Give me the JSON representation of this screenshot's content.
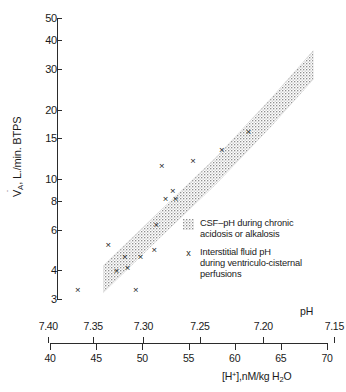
{
  "chart_data": {
    "type": "scatter",
    "title": "",
    "xlabel": "[H⁺], nM/kg H₂O",
    "xlabel_secondary": "pH",
    "ylabel": "V̇A, L./min. BTPS",
    "yscale": "log",
    "ylim": [
      3,
      50
    ],
    "xlim": [
      40,
      70
    ],
    "grid": false,
    "axis_top_label": "pH",
    "axis_bottom_label": "[H+],nM/kg H2O",
    "y_ticks": [
      3,
      4,
      6,
      8,
      10,
      15,
      20,
      30,
      40,
      50
    ],
    "y_tick_labels": [
      "3",
      "4",
      "6",
      "8",
      "10",
      "15",
      "20",
      "30",
      "40",
      "50"
    ],
    "x_ticks_h": [
      40,
      45,
      50,
      55,
      60,
      65,
      70
    ],
    "x_tick_labels_h": [
      "40",
      "45",
      "50",
      "55",
      "60",
      "65",
      "70"
    ],
    "x_ticks_ph": [
      7.4,
      7.35,
      7.3,
      7.25,
      7.2,
      7.15
    ],
    "x_tick_labels_ph": [
      "7.40",
      "7.35",
      "7.30",
      "7.25",
      "7.20",
      "7.15"
    ],
    "series": [
      {
        "name": "CSF-pH during chronic acidosis or alkalosis",
        "type": "band",
        "style": "stippled",
        "description": "Diagonal stippled band rising from lower-left to upper-right",
        "band_points": [
          {
            "h": 45.8,
            "va_low": 3.2,
            "va_high": 4.2
          },
          {
            "h": 52.0,
            "va_low": 5.6,
            "va_high": 7.3
          },
          {
            "h": 58.0,
            "va_low": 9.5,
            "va_high": 12.4
          },
          {
            "h": 64.0,
            "va_low": 17.0,
            "va_high": 22.5
          },
          {
            "h": 68.5,
            "va_low": 27.0,
            "va_high": 36.0
          }
        ]
      },
      {
        "name": "Interstitial fluid pH during ventriculo-cisternal perfusions",
        "type": "scatter",
        "marker": "x",
        "points": [
          {
            "h": 43.0,
            "va": 3.3
          },
          {
            "h": 46.3,
            "va": 5.2
          },
          {
            "h": 47.2,
            "va": 4.0
          },
          {
            "h": 48.4,
            "va": 4.1
          },
          {
            "h": 48.1,
            "va": 4.6
          },
          {
            "h": 49.8,
            "va": 4.6
          },
          {
            "h": 49.3,
            "va": 3.3
          },
          {
            "h": 51.3,
            "va": 4.9
          },
          {
            "h": 51.5,
            "va": 6.3
          },
          {
            "h": 52.5,
            "va": 8.2
          },
          {
            "h": 53.3,
            "va": 8.9
          },
          {
            "h": 53.6,
            "va": 8.2
          },
          {
            "h": 52.1,
            "va": 11.4
          },
          {
            "h": 55.5,
            "va": 12.0
          },
          {
            "h": 58.6,
            "va": 13.4
          },
          {
            "h": 61.5,
            "va": 16.1
          }
        ]
      }
    ],
    "legend_position": "right-lower"
  },
  "legend": {
    "items": [
      {
        "marker": "band-swatch",
        "line1": "CSF–pH during chronic",
        "line2": "acidosis or alkalosis"
      },
      {
        "marker": "x",
        "line1": "Interstitial fluid pH",
        "line2": "during ventriculo‑cisternal",
        "line3": "perfusions"
      }
    ]
  },
  "axes": {
    "y_title_prefix": "V",
    "y_title_sub": "A",
    "y_title_rest": ", L./min. BTPS",
    "x_top_title": "pH",
    "x_bottom_prefix": "[H",
    "x_bottom_sup": "+",
    "x_bottom_mid": "],nM/kg H",
    "x_bottom_sub": "2",
    "x_bottom_suffix": "O"
  }
}
